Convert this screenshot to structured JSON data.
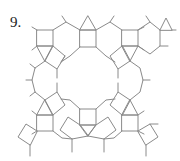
{
  "figure": {
    "number_label": "9.",
    "line_color": "#8a8a8a",
    "label_color": "#222222"
  }
}
